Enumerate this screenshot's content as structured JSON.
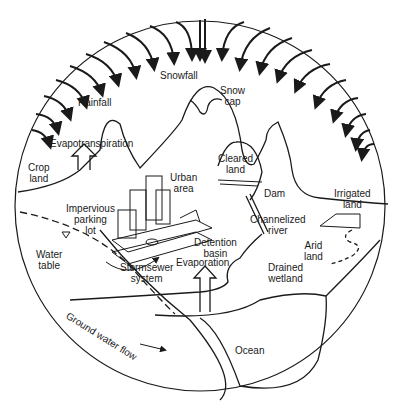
{
  "diagram": {
    "colors": {
      "ink": "#1a1a1a",
      "background": "#ffffff"
    },
    "labels": {
      "snowfall": "Snowfall",
      "snow_cap": [
        "Snow",
        "cap"
      ],
      "rainfall": "Rainfall",
      "evapotranspiration": "Evapotranspiration",
      "crop_land": [
        "Crop",
        "land"
      ],
      "urban_area": [
        "Urban",
        "area"
      ],
      "cleared_land": [
        "Cleared",
        "land"
      ],
      "dam": "Dam",
      "irrigated_land": [
        "Irrigated",
        "land"
      ],
      "impervious_parking_lot": [
        "Impervious",
        "parking",
        "lot"
      ],
      "channelized_river": [
        "Channelized",
        "river"
      ],
      "water_table": [
        "Water",
        "table"
      ],
      "detention_basin": [
        "Detention",
        "basin"
      ],
      "arid_land": [
        "Arid",
        "land"
      ],
      "stormsewer_system": [
        "Stormsewer",
        "system"
      ],
      "evaporation": "Evaporation",
      "drained_wetland": [
        "Drained",
        "wetland"
      ],
      "ground_water_flow": "Ground water flow",
      "ocean": "Ocean"
    },
    "icons": [
      "precipitation-arrow",
      "evapotranspiration-arrow",
      "evaporation-arrow",
      "water-table-marker",
      "building",
      "car",
      "ground-water-flow-arrow"
    ]
  }
}
